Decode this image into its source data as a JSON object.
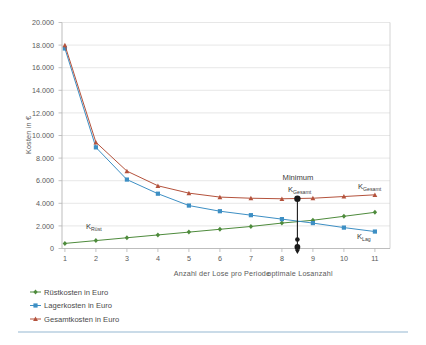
{
  "chart_data": {
    "type": "line",
    "title": "",
    "xlabel": "Anzahl der Lose pro Periode",
    "ylabel": "Kosten in €",
    "x": [
      1,
      2,
      3,
      4,
      5,
      6,
      7,
      8,
      9,
      10,
      11
    ],
    "xlim": [
      0.6,
      11.4
    ],
    "ylim": [
      0,
      20000
    ],
    "ytick_values": [
      0,
      2000,
      4000,
      6000,
      8000,
      10000,
      12000,
      14000,
      16000,
      18000,
      20000
    ],
    "ytick_labels": [
      "0",
      "2.000",
      "4.000",
      "6.000",
      "8.000",
      "10.000",
      "12.000",
      "14.000",
      "16.000",
      "18.000",
      "20.000"
    ],
    "xtick_labels": [
      "1",
      "2",
      "3",
      "4",
      "5",
      "6",
      "7",
      "8",
      "9",
      "10",
      "11"
    ],
    "grid": "horizontal",
    "legend_position": "below-left",
    "series": [
      {
        "name": "Rüstkosten in Euro",
        "key": "ruestkosten",
        "color": "#4e8b3c",
        "marker": "diamond",
        "values": [
          450,
          700,
          950,
          1200,
          1450,
          1700,
          1950,
          2250,
          2500,
          2850,
          3200
        ]
      },
      {
        "name": "Lagerkosten in Euro",
        "key": "lagerkosten",
        "color": "#3d8fc4",
        "marker": "square",
        "values": [
          17700,
          8950,
          6100,
          4850,
          3800,
          3300,
          2950,
          2600,
          2250,
          1850,
          1500
        ]
      },
      {
        "name": "Gesamtkosten in Euro",
        "key": "gesamtkosten",
        "color": "#b4523c",
        "marker": "triangle",
        "values": [
          18000,
          9400,
          6850,
          5550,
          4900,
          4550,
          4450,
          4400,
          4450,
          4600,
          4750
        ]
      }
    ],
    "annotations": [
      {
        "key": "minimum",
        "text": "Minimum",
        "x": 8.5,
        "y": 5800
      },
      {
        "key": "k-gesamt-min",
        "base": "K",
        "sub": "Gesamt",
        "x": 8.5,
        "y": 5200
      },
      {
        "key": "k-gesamt-right",
        "base": "K",
        "sub": "Gesamt",
        "x": 10.6,
        "y": 5450
      },
      {
        "key": "k-ruest",
        "base": "K",
        "sub": "Rüst",
        "x": 2.9,
        "y": 1750
      },
      {
        "key": "k-lag",
        "base": "K",
        "sub": "Lag",
        "x": 10.6,
        "y": 1100
      },
      {
        "key": "optimale",
        "text": "optimale Losanzahl",
        "x": 8.5,
        "y": -1900
      }
    ],
    "marker_line": {
      "x": 8.5,
      "y_top": 4400,
      "y_bottom": 0,
      "color": "#1a1a1a"
    }
  }
}
